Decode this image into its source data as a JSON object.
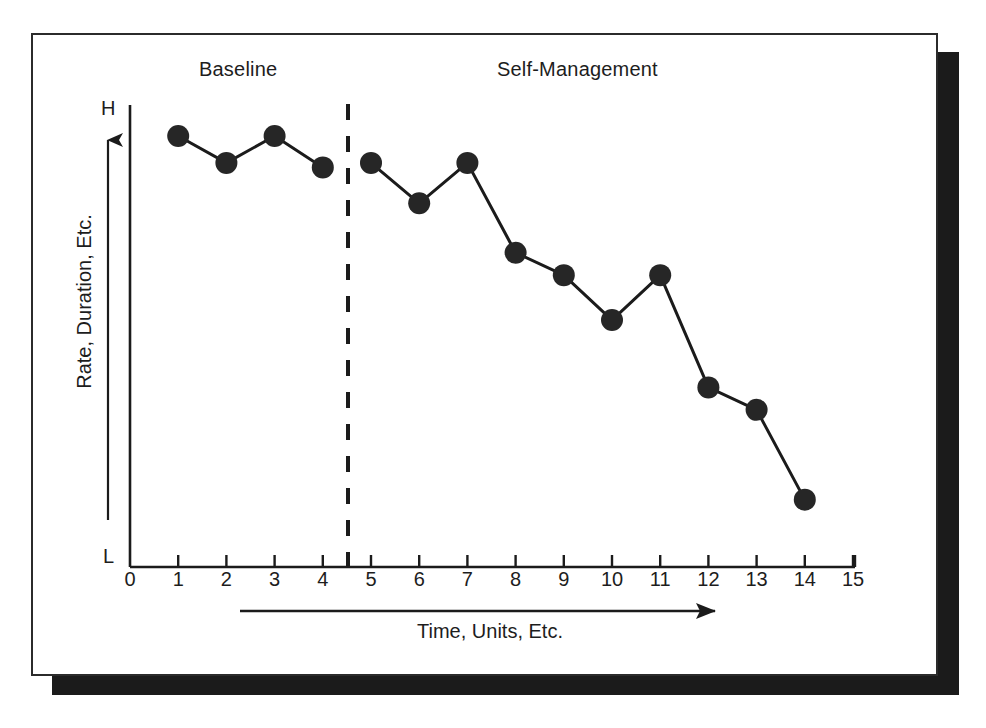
{
  "figure": {
    "title_phase_a": "Baseline",
    "title_phase_b": "Self-Management",
    "y_axis_label": "Rate, Duration, Etc.",
    "y_high_cap": "H",
    "y_low_cap": "L",
    "x_axis_label": "Time, Units, Etc.",
    "stroke_color": "#1b1b1b",
    "marker_color": "#262626",
    "background_color": "#ffffff",
    "frame_border_color": "#2b2b2b",
    "shadow_color": "#1b1b1b"
  },
  "chart_data": {
    "type": "line",
    "title": "",
    "subtitle": "",
    "xlabel": "Time, Units, Etc.",
    "ylabel": "Rate, Duration, Etc.",
    "xlim": [
      0,
      15
    ],
    "ylim": [
      0,
      100
    ],
    "grid": false,
    "legend": "none",
    "y_tick_labels": [
      "L",
      "H"
    ],
    "x_tick_labels": [
      "0",
      "1",
      "2",
      "3",
      "4",
      "5",
      "6",
      "7",
      "8",
      "9",
      "10",
      "11",
      "12",
      "13",
      "14",
      "15"
    ],
    "x": [
      1,
      2,
      3,
      4,
      5,
      6,
      7,
      8,
      9,
      10,
      11,
      12,
      13,
      14
    ],
    "series": [
      {
        "name": "Baseline",
        "phase": "A",
        "x": [
          1,
          2,
          3,
          4
        ],
        "values": [
          96,
          90,
          96,
          89
        ]
      },
      {
        "name": "Self-Management",
        "phase": "B",
        "x": [
          5,
          6,
          7,
          8,
          9,
          10,
          11,
          12,
          13,
          14
        ],
        "values": [
          90,
          81,
          90,
          70,
          65,
          55,
          65,
          40,
          35,
          15
        ]
      }
    ],
    "annotations": [
      {
        "type": "phase-line",
        "style": "dashed",
        "x": 4.5,
        "label": ""
      },
      {
        "type": "phase-label",
        "text": "Baseline",
        "x": 2.5
      },
      {
        "type": "phase-label",
        "text": "Self-Management",
        "x": 9.5
      },
      {
        "type": "arrow",
        "text": "Time, Units, Etc.",
        "direction": "right",
        "from_x": 2.3,
        "to_x": 11.2
      },
      {
        "type": "arrow",
        "text": "",
        "direction": "up",
        "axis": "y"
      }
    ]
  }
}
